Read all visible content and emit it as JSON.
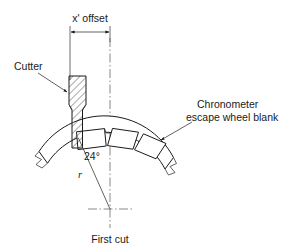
{
  "figure": {
    "background_color": "#ffffff",
    "line_color": "#1a1a1a",
    "width": 289,
    "height": 252
  },
  "labels": {
    "offset_dimension": "x' offset",
    "cutter": "Cutter",
    "workpiece_line1": "Chronometer",
    "workpiece_line2": "escape wheel blank",
    "angle": "24°",
    "radius": "r",
    "first_cut": "First cut"
  },
  "geometry": {
    "wheel_center_x": 110,
    "wheel_center_y": 209,
    "outer_radius": 78,
    "inner_radius": 68,
    "angle_degrees": 24,
    "offset_left_x": 70,
    "offset_right_x": 110,
    "dimension_line_y": 32,
    "cutter_top_y": 76,
    "cutter_left_x": 69,
    "cutter_right_x": 86,
    "shank_left_x": 72,
    "shank_right_x": 82
  }
}
